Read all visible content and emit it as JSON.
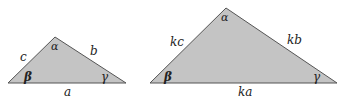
{
  "figure": {
    "fill_color": "#c4c4c4",
    "stroke_color": "#555555",
    "small_triangle": {
      "sides": {
        "a": "a",
        "b": "b",
        "c": "c"
      },
      "angles": {
        "alpha": "α",
        "beta": "β",
        "gamma": "γ"
      }
    },
    "large_triangle": {
      "sides": {
        "a": "ka",
        "b": "kb",
        "c": "kc"
      },
      "angles": {
        "alpha": "α",
        "beta": "β",
        "gamma": "γ"
      }
    }
  }
}
